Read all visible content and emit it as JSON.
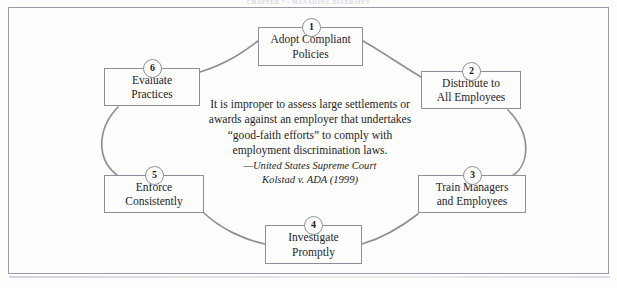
{
  "page": {
    "running_head": "CHAPTER 7  •  MANAGING DIVERSITY",
    "frame_color": "#9a9aa8",
    "background": "#fdfdfc",
    "ink_color": "#242428",
    "connector_color": "#8f8f9b"
  },
  "diagram": {
    "type": "cycle",
    "step_count": 6,
    "steps": [
      {
        "number": "1",
        "label": "Adopt Compliant\nPolicies"
      },
      {
        "number": "2",
        "label": "Distribute to\nAll Employees"
      },
      {
        "number": "3",
        "label": "Train Managers\nand Employees"
      },
      {
        "number": "4",
        "label": "Investigate\nPromptly"
      },
      {
        "number": "5",
        "label": "Enforce\nConsistently"
      },
      {
        "number": "6",
        "label": "Evaluate\nPractices"
      }
    ]
  },
  "quote": {
    "text": "It is improper to assess large settlements or awards against an employer that undertakes “good-faith efforts”  to comply with employment discrimination laws.",
    "attribution_court": "—United States Supreme Court",
    "attribution_case": "Kolstad v. ADA (1999)"
  }
}
